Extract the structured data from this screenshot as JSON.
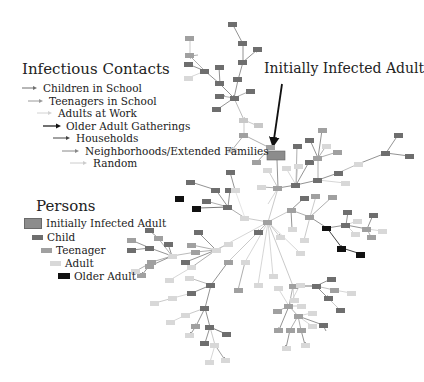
{
  "contacts_legend": {
    "title": "Infectious Contacts",
    "items": [
      {
        "label": "Children in School",
        "color": "#6f6f6f"
      },
      {
        "label": "Teenagers in School",
        "color": "#9a9a9a"
      },
      {
        "label": "Adults at Work",
        "color": "#d2d2d2"
      },
      {
        "label": "Older Adult Gatherings",
        "color": "#111111"
      },
      {
        "label": "Households",
        "color": "#444444"
      },
      {
        "label": "Neighborhoods/Extended Families",
        "color": "#888888"
      },
      {
        "label": "Random",
        "color": "#cccccc"
      }
    ]
  },
  "persons_legend": {
    "title": "Persons",
    "items": [
      {
        "label": "Initially Infected Adult",
        "color": "#8c8c8c"
      },
      {
        "label": "Child",
        "color": "#6e6e6e"
      },
      {
        "label": "Teenager",
        "color": "#a0a0a0"
      },
      {
        "label": "Adult",
        "color": "#d8d8d8"
      },
      {
        "label": "Older Adult",
        "color": "#111111"
      }
    ]
  },
  "callout": {
    "label": "Initially Infected Adult"
  }
}
